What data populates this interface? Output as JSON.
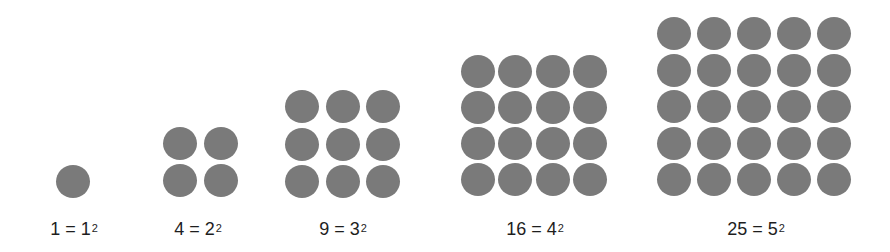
{
  "figure": {
    "dot_color": "#7a7a7a",
    "text_color": "#1e1e1e",
    "groups": [
      {
        "n": 1,
        "rows": 1,
        "cols": 1,
        "left": 56,
        "top": 165,
        "dx": 0,
        "dy": 0,
        "label_center_x": 74,
        "label": {
          "value": "1",
          "equals": "=",
          "base": "1",
          "exponent": "2"
        }
      },
      {
        "n": 2,
        "rows": 2,
        "cols": 2,
        "left": 163,
        "top": 127,
        "dx": 41,
        "dy": 37,
        "label_center_x": 198,
        "label": {
          "value": "4",
          "equals": "=",
          "base": "2",
          "exponent": "2"
        }
      },
      {
        "n": 3,
        "rows": 3,
        "cols": 3,
        "left": 285,
        "top": 90,
        "dx": 40.5,
        "dy": 37.5,
        "label_center_x": 343,
        "label": {
          "value": "9",
          "equals": "=",
          "base": "3",
          "exponent": "2"
        }
      },
      {
        "n": 4,
        "rows": 4,
        "cols": 4,
        "left": 461,
        "top": 55,
        "dx": 37.3,
        "dy": 36,
        "label_center_x": 535,
        "label": {
          "value": "16",
          "equals": "=",
          "base": "4",
          "exponent": "2"
        }
      },
      {
        "n": 5,
        "rows": 5,
        "cols": 5,
        "left": 657,
        "top": 17,
        "dx": 40,
        "dy": 36.5,
        "label_center_x": 756,
        "label": {
          "value": "25",
          "equals": "=",
          "base": "5",
          "exponent": "2"
        }
      }
    ]
  }
}
